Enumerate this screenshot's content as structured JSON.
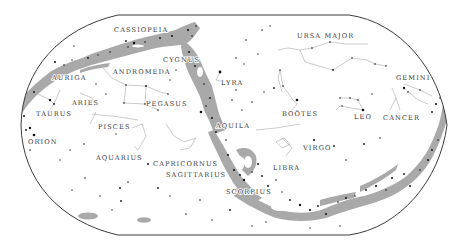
{
  "map": {
    "type": "celestial-star-map",
    "projection": "equal-area-oval",
    "colors": {
      "background": "#ffffff",
      "milky_way": "#a9a9a9",
      "outline": "#3c3c3c",
      "constellation_lines": "#a8a8a8",
      "stars": "#111111",
      "labels": "#3a3a3a"
    },
    "constellations": [
      {
        "name": "CASSIOPEIA",
        "x": 114,
        "y": 29
      },
      {
        "name": "CYGNUS",
        "x": 164,
        "y": 59
      },
      {
        "name": "URSA MAJOR",
        "x": 297,
        "y": 39
      },
      {
        "name": "AURIGA",
        "x": 53,
        "y": 78
      },
      {
        "name": "ANDROMEDA",
        "x": 113,
        "y": 74
      },
      {
        "name": "LYRA",
        "x": 222,
        "y": 84
      },
      {
        "name": "GEMINI",
        "x": 396,
        "y": 79
      },
      {
        "name": "ARIES",
        "x": 72,
        "y": 104
      },
      {
        "name": "PEGASUS",
        "x": 145,
        "y": 105
      },
      {
        "name": "TAURUS",
        "x": 38,
        "y": 115
      },
      {
        "name": "PISCES",
        "x": 98,
        "y": 128
      },
      {
        "name": "AQUILA",
        "x": 216,
        "y": 125
      },
      {
        "name": "BOÖTES",
        "x": 282,
        "y": 114
      },
      {
        "name": "LEO",
        "x": 355,
        "y": 117
      },
      {
        "name": "CANCER",
        "x": 384,
        "y": 119
      },
      {
        "name": "ORION",
        "x": 28,
        "y": 142
      },
      {
        "name": "VIRGO",
        "x": 303,
        "y": 148
      },
      {
        "name": "AQUARIUS",
        "x": 97,
        "y": 159
      },
      {
        "name": "CAPRICORNUS",
        "x": 153,
        "y": 164
      },
      {
        "name": "LIBRA",
        "x": 273,
        "y": 168
      },
      {
        "name": "SAGITTARIUS",
        "x": 166,
        "y": 176
      },
      {
        "name": "SCORPIUS",
        "x": 226,
        "y": 192
      }
    ]
  }
}
